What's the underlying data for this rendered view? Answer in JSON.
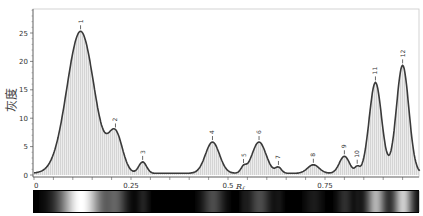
{
  "chart_data": {
    "type": "line",
    "title": "",
    "xlabel": "R_f",
    "xlabel_main": "R",
    "xlabel_sub": "f",
    "ylabel": "灰度",
    "xlim": [
      0,
      1.0
    ],
    "ylim": [
      0,
      28
    ],
    "x_ticks": [
      0,
      0.25,
      0.5,
      0.75
    ],
    "x_tick_labels": [
      "0",
      "0.25",
      "0.5",
      "0.75"
    ],
    "y_ticks": [
      0,
      5,
      10,
      15,
      20,
      25
    ],
    "y_tick_labels": [
      "0",
      "5",
      "10",
      "15",
      "20",
      "25"
    ],
    "grid": false,
    "fill": "light gray area under curve",
    "peaks": [
      {
        "label": "1",
        "rf": 0.12,
        "value": 25.0,
        "width": 0.035
      },
      {
        "label": "2",
        "rf": 0.21,
        "value": 6.8,
        "width": 0.018
      },
      {
        "label": "3",
        "rf": 0.28,
        "value": 2.0,
        "width": 0.01
      },
      {
        "label": "4",
        "rf": 0.46,
        "value": 5.5,
        "width": 0.018
      },
      {
        "label": "5",
        "rf": 0.54,
        "value": 1.0,
        "width": 0.007
      },
      {
        "label": "6",
        "rf": 0.58,
        "value": 5.5,
        "width": 0.018
      },
      {
        "label": "7",
        "rf": 0.63,
        "value": 1.0,
        "width": 0.008
      },
      {
        "label": "8",
        "rf": 0.72,
        "value": 1.5,
        "width": 0.015
      },
      {
        "label": "9",
        "rf": 0.8,
        "value": 3.0,
        "width": 0.013
      },
      {
        "label": "10",
        "rf": 0.833,
        "value": 1.0,
        "width": 0.006
      },
      {
        "label": "11",
        "rf": 0.88,
        "value": 16.0,
        "width": 0.016
      },
      {
        "label": "12",
        "rf": 0.95,
        "value": 19.0,
        "width": 0.016
      }
    ],
    "baseline": 0.3,
    "strip": "grayscale densitometry band image below axis"
  },
  "colors": {
    "line": "#3a3a3a",
    "fill": "#d9d9d9",
    "axis": "#555555",
    "frame": "#bbbbbb"
  }
}
